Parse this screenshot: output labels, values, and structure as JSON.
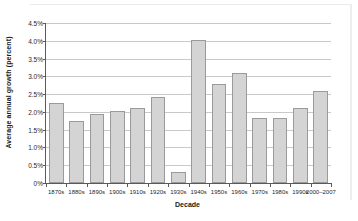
{
  "chart_data": {
    "type": "bar",
    "title": "",
    "xlabel": "Decade",
    "ylabel": "Average annual growth (percent)",
    "categories": [
      "1870s",
      "1880s",
      "1890s",
      "1900s",
      "1910s",
      "1920s",
      "1930s",
      "1940s",
      "1950s",
      "1960s",
      "1970s",
      "1980s",
      "1990s",
      "2000–2007"
    ],
    "values": [
      2.25,
      1.75,
      1.93,
      2.02,
      2.12,
      2.42,
      0.3,
      4.02,
      2.79,
      3.1,
      1.82,
      1.82,
      2.1,
      2.6
    ],
    "ylim": [
      0,
      4.5
    ],
    "ytick_values": [
      0,
      0.5,
      1.0,
      1.5,
      2.0,
      2.5,
      3.0,
      3.5,
      4.0,
      4.5
    ],
    "ytick_labels": [
      "0%",
      "0.5%",
      "1.0%",
      "1.5%",
      "2.0%",
      "2.5%",
      "3.0%",
      "3.5%",
      "4.0%",
      "4.5%"
    ],
    "grid": "horizontal",
    "legend": "none",
    "bar_fill_color": "#d4d4d4",
    "bar_border_color": "#9a9a9a",
    "gridline_color": "#c9c9c9",
    "axis_color": "#5a5a5a",
    "background_color": "#ffffff"
  }
}
